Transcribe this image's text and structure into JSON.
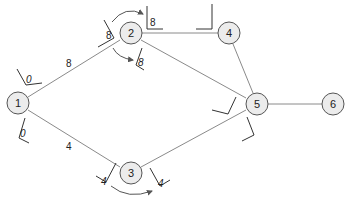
{
  "diagram": {
    "type": "network-graph",
    "nodes": [
      {
        "id": "1",
        "label": "1",
        "x": 18,
        "y": 103
      },
      {
        "id": "2",
        "label": "2",
        "x": 131,
        "y": 33
      },
      {
        "id": "3",
        "label": "3",
        "x": 131,
        "y": 173
      },
      {
        "id": "4",
        "label": "4",
        "x": 229,
        "y": 33
      },
      {
        "id": "5",
        "label": "5",
        "x": 257,
        "y": 103
      },
      {
        "id": "6",
        "label": "6",
        "x": 333,
        "y": 103
      }
    ],
    "edges": [
      {
        "from": "1",
        "to": "2",
        "weight": "8"
      },
      {
        "from": "1",
        "to": "3",
        "weight": "4"
      },
      {
        "from": "2",
        "to": "4",
        "weight": ""
      },
      {
        "from": "2",
        "to": "5",
        "weight": ""
      },
      {
        "from": "3",
        "to": "5",
        "weight": ""
      },
      {
        "from": "4",
        "to": "5",
        "weight": ""
      },
      {
        "from": "5",
        "to": "6",
        "weight": ""
      }
    ],
    "edge_labels": {
      "e12": "8",
      "e13": "4"
    },
    "node_marks": {
      "n1_top": "0",
      "n1_bottom": "0",
      "n2_in": "8",
      "n2_out_top": "8",
      "n2_out_bottom": "8",
      "n3_in": "4",
      "n3_out": "4"
    },
    "colors": {
      "node_fill": "#ececec",
      "node_stroke": "#555555",
      "edge": "#8a8a8a"
    }
  }
}
